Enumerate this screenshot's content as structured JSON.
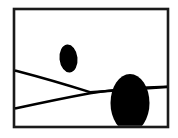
{
  "canvas": {
    "width": 178,
    "height": 138,
    "background_color": "#ffffff"
  },
  "figure": {
    "frame": {
      "name": "outer-rectangle-frame",
      "x": 14,
      "y": 9,
      "width": 154,
      "height": 118,
      "stroke_color": "#1a1a1a",
      "stroke_width": 2.6,
      "fill_color": "#ffffff"
    },
    "shapes": [
      {
        "name": "small-ellipse",
        "kind": "ellipse",
        "cx": 68.5,
        "cy": 58.5,
        "rx": 9.0,
        "ry": 14.0,
        "fill_color": "#000000",
        "rotation": -6
      },
      {
        "name": "large-ellipse",
        "kind": "ellipse",
        "cx": 130.0,
        "cy": 103.0,
        "rx": 19.5,
        "ry": 29.0,
        "fill_color": "#000000",
        "rotation": 0
      }
    ],
    "curves": [
      {
        "name": "upper-curve",
        "kind": "path",
        "path": "M 15 70.5 Q 55 81 90 92.2 L 167 87.0",
        "stroke_color": "#000000",
        "stroke_width": 2.4
      },
      {
        "name": "lower-curve",
        "kind": "path",
        "path": "M 15 108.5 Q 56 99.5 90 93.2 Q 128 87.5 167 86.6",
        "stroke_color": "#000000",
        "stroke_width": 2.4
      }
    ]
  }
}
